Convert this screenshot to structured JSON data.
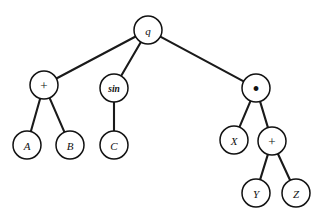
{
  "figure": {
    "background_color": "#ffffff",
    "stroke_color": "#111111",
    "edge_color": "#1a1a1a",
    "width": 323,
    "height": 222
  },
  "nodes": [
    {
      "id": "q",
      "label": "q",
      "kind": "variable",
      "x": 148,
      "y": 30,
      "r": 14,
      "style": "italic"
    },
    {
      "id": "plusL",
      "label": "+",
      "kind": "operator",
      "x": 44,
      "y": 85,
      "r": 14,
      "style": "op-plus"
    },
    {
      "id": "sin",
      "label": "sin",
      "kind": "function",
      "x": 114,
      "y": 88,
      "r": 14,
      "style": "fn-sin"
    },
    {
      "id": "times",
      "label": "•",
      "kind": "operator",
      "x": 256,
      "y": 88,
      "r": 14,
      "style": "op-times"
    },
    {
      "id": "A",
      "label": "A",
      "kind": "variable",
      "x": 27,
      "y": 145,
      "r": 14,
      "style": "italic"
    },
    {
      "id": "B",
      "label": "B",
      "kind": "variable",
      "x": 70,
      "y": 145,
      "r": 14,
      "style": "italic"
    },
    {
      "id": "C",
      "label": "C",
      "kind": "variable",
      "x": 114,
      "y": 145,
      "r": 14,
      "style": "italic"
    },
    {
      "id": "X",
      "label": "X",
      "kind": "variable",
      "x": 234,
      "y": 140,
      "r": 14,
      "style": "italic"
    },
    {
      "id": "plusR",
      "label": "+",
      "kind": "operator",
      "x": 272,
      "y": 141,
      "r": 14,
      "style": "op-plus"
    },
    {
      "id": "Y",
      "label": "Y",
      "kind": "variable",
      "x": 256,
      "y": 193,
      "r": 14,
      "style": "italic"
    },
    {
      "id": "Z",
      "label": "Z",
      "kind": "variable",
      "x": 296,
      "y": 193,
      "r": 14,
      "style": "italic"
    }
  ],
  "edges": [
    {
      "from": "q",
      "to": "plusL"
    },
    {
      "from": "q",
      "to": "sin"
    },
    {
      "from": "q",
      "to": "times"
    },
    {
      "from": "plusL",
      "to": "A"
    },
    {
      "from": "plusL",
      "to": "B"
    },
    {
      "from": "sin",
      "to": "C"
    },
    {
      "from": "times",
      "to": "X"
    },
    {
      "from": "times",
      "to": "plusR"
    },
    {
      "from": "plusR",
      "to": "Y"
    },
    {
      "from": "plusR",
      "to": "Z"
    }
  ],
  "labels": {
    "root": "q",
    "plus_left": "+",
    "sin": "sin",
    "times": "•",
    "a": "A",
    "b": "B",
    "c": "C",
    "x": "X",
    "plus_right": "+",
    "y": "Y",
    "z": "Z"
  }
}
